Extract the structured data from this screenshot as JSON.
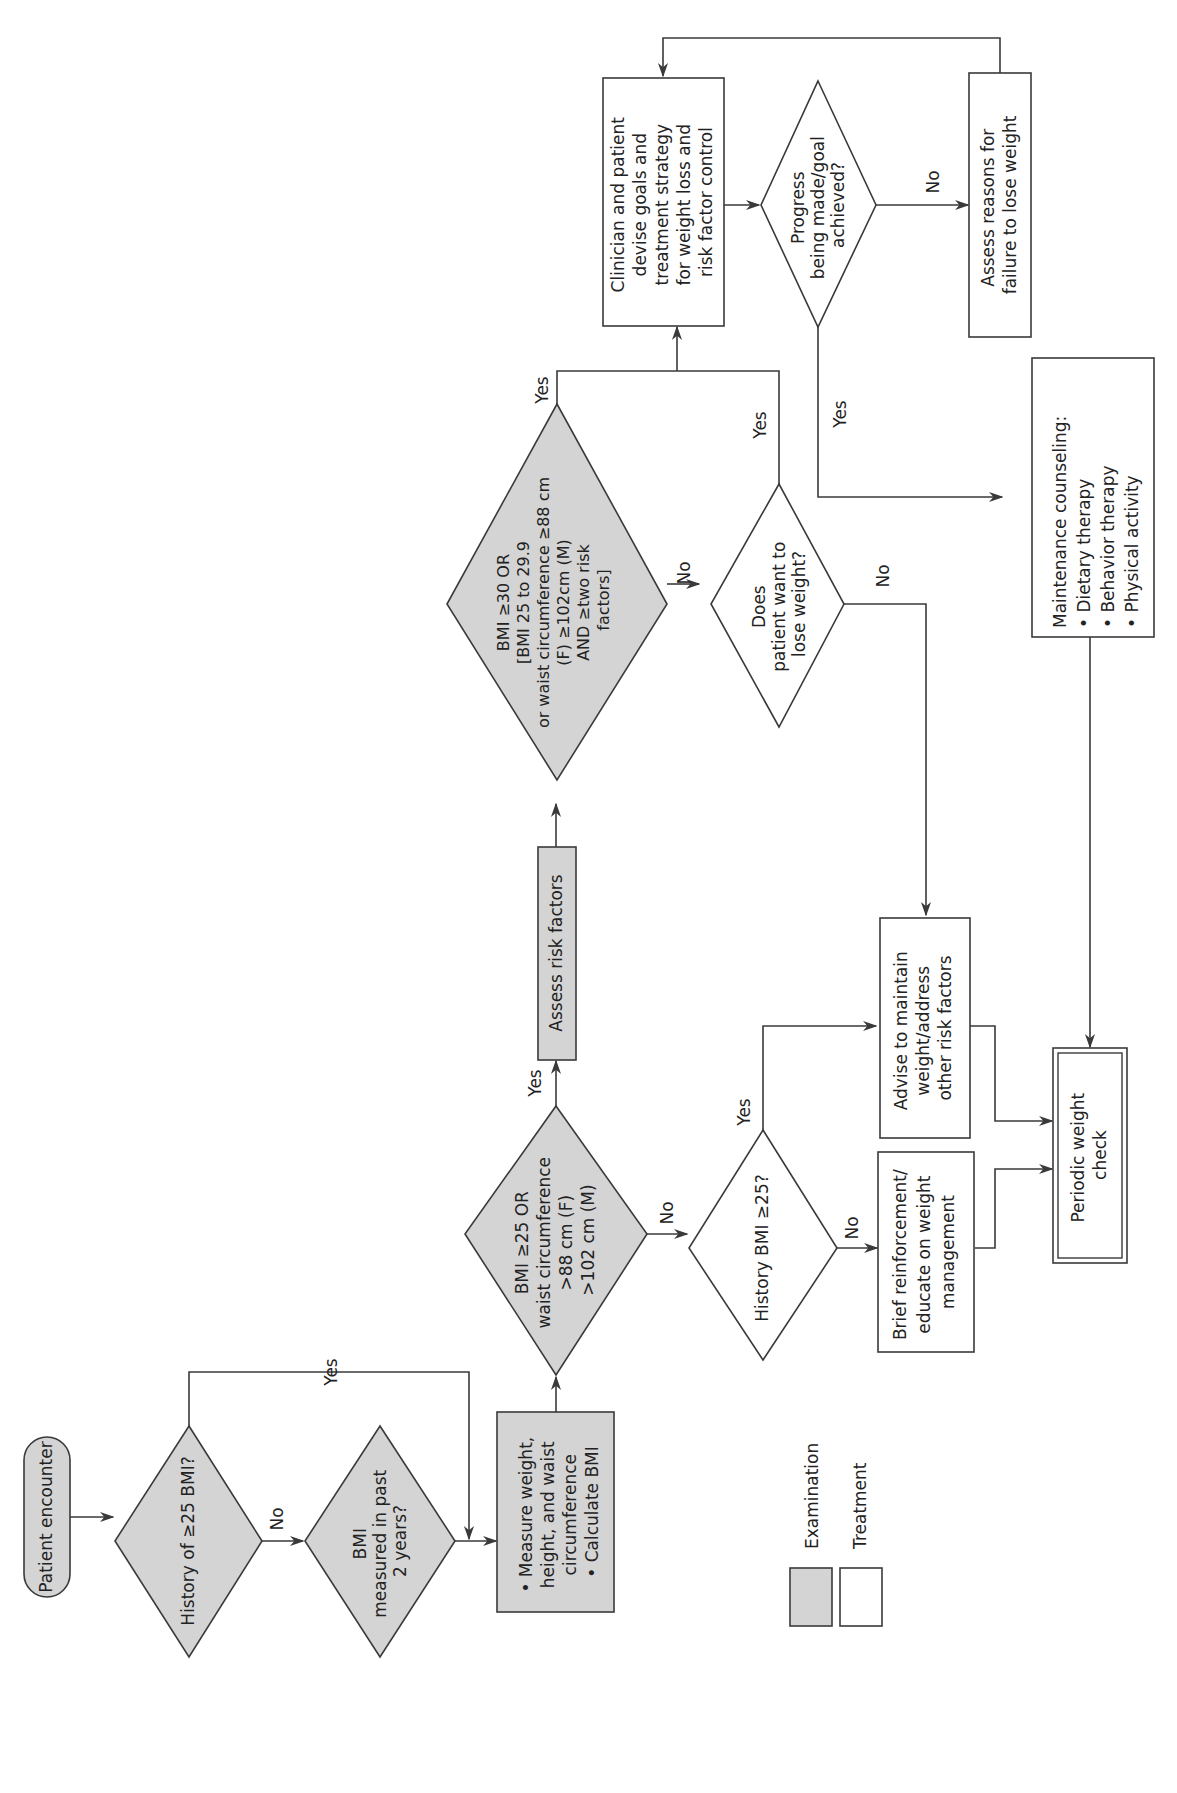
{
  "colors": {
    "examination_fill": "#d4d4d4",
    "treatment_fill": "#ffffff",
    "stroke": "#3a3a3a",
    "text": "#222222"
  },
  "orientation": "rotated 90 degrees counter-clockwise",
  "nodes": {
    "start": {
      "type": "terminal",
      "category": "Examination",
      "lines": [
        "Patient encounter"
      ]
    },
    "history_bmi": {
      "type": "decision",
      "category": "Examination",
      "lines": [
        "History of ≥25 BMI?"
      ]
    },
    "bmi_measured": {
      "type": "decision",
      "category": "Examination",
      "lines": [
        "BMI",
        "measured in past",
        "2 years?"
      ]
    },
    "measure": {
      "type": "process",
      "category": "Examination",
      "lines": [
        "• Measure weight,",
        "   height, and waist",
        "   circumference",
        "• Calculate BMI"
      ]
    },
    "bmi25": {
      "type": "decision",
      "category": "Examination",
      "lines": [
        "BMI ≥25 OR",
        "waist circumference",
        ">88 cm (F)",
        ">102 cm (M)"
      ]
    },
    "assess_risk": {
      "type": "process",
      "category": "Examination",
      "lines": [
        "Assess risk factors"
      ]
    },
    "bmi30": {
      "type": "decision",
      "category": "Examination",
      "lines": [
        "BMI ≥30 OR",
        "[BMI 25 to 29.9",
        "or waist circumference ≥88 cm",
        "(F) ≥102cm (M)",
        "AND ≥two risk",
        "factors]"
      ]
    },
    "history_bmi25": {
      "type": "decision",
      "category": "Treatment",
      "lines": [
        "History BMI ≥25?"
      ]
    },
    "want_lose": {
      "type": "decision",
      "category": "Treatment",
      "lines": [
        "Does",
        "patient want to",
        "lose weight?"
      ]
    },
    "brief": {
      "type": "process",
      "category": "Treatment",
      "lines": [
        "Brief reinforcement/",
        "educate on weight",
        "management"
      ]
    },
    "advise": {
      "type": "process",
      "category": "Treatment",
      "lines": [
        "Advise to maintain",
        "weight/address",
        "other risk factors"
      ]
    },
    "periodic": {
      "type": "terminal-double",
      "category": "Treatment",
      "lines": [
        "Periodic weight",
        "check"
      ]
    },
    "clinician": {
      "type": "process",
      "category": "Treatment",
      "lines": [
        "Clinician and patient",
        "devise goals and",
        "treatment strategy",
        "for weight loss and",
        "risk factor control"
      ]
    },
    "progress": {
      "type": "decision",
      "category": "Treatment",
      "lines": [
        "Progress",
        "being made/goal",
        "achieved?"
      ]
    },
    "assess_reasons": {
      "type": "process",
      "category": "Treatment",
      "lines": [
        "Assess reasons for",
        "failure to lose weight"
      ]
    },
    "maintenance": {
      "type": "process",
      "category": "Treatment",
      "lines": [
        "Maintenance counseling:",
        "• Dietary therapy",
        "• Behavior therapy",
        "• Physical activity"
      ]
    }
  },
  "edge_labels": {
    "history_yes": "Yes",
    "history_no": "No",
    "bmi25_yes": "Yes",
    "bmi25_no": "No",
    "bmi30_yes": "Yes",
    "bmi30_no": "No",
    "want_yes": "Yes",
    "want_no": "No",
    "hist25_yes": "Yes",
    "hist25_no": "No",
    "progress_yes": "Yes",
    "progress_no": "No"
  },
  "legend": {
    "items": [
      {
        "label": "Examination",
        "fill": "#d4d4d4"
      },
      {
        "label": "Treatment",
        "fill": "#ffffff"
      }
    ]
  }
}
